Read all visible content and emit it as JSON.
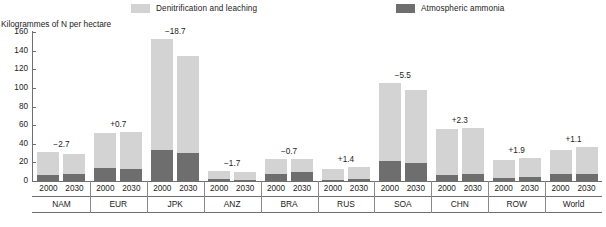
{
  "chart_data": {
    "type": "bar",
    "title": "",
    "ylabel": "Kilogrammes of N per hectare",
    "xlabel": "",
    "ylim": [
      0,
      160
    ],
    "yticks": [
      0,
      20,
      40,
      60,
      80,
      100,
      120,
      140,
      160
    ],
    "grid": false,
    "legend_position": "top",
    "stacked": true,
    "legend": [
      {
        "name": "Denitrification and leaching",
        "color": "#d3d3d3"
      },
      {
        "name": "Atmospheric ammonia",
        "color": "#6e6e6e"
      }
    ],
    "series": [
      {
        "name": "Atmospheric ammonia",
        "color": "#6e6e6e",
        "values": [
          6.5,
          7.5,
          13.5,
          13.0,
          33.0,
          30.0,
          2.0,
          1.5,
          7.5,
          9.5,
          1.5,
          2.0,
          21.5,
          19.0,
          6.5,
          8.0,
          3.0,
          4.0,
          7.0,
          8.0
        ]
      },
      {
        "name": "Denitrification and leaching",
        "color": "#d3d3d3",
        "values": [
          25.0,
          21.5,
          38.5,
          40.0,
          120.0,
          104.0,
          9.0,
          8.0,
          16.5,
          14.0,
          11.5,
          13.0,
          83.5,
          79.0,
          49.5,
          49.0,
          20.0,
          21.0,
          26.0,
          28.0
        ]
      }
    ],
    "x": [
      "2000",
      "2030",
      "2000",
      "2030",
      "2000",
      "2030",
      "2000",
      "2030",
      "2000",
      "2030",
      "2000",
      "2030",
      "2000",
      "2030",
      "2000",
      "2030",
      "2000",
      "2030",
      "2000",
      "2030"
    ],
    "totals": [
      31.5,
      29.0,
      52.0,
      53.0,
      153.0,
      134.0,
      11.0,
      9.5,
      24.0,
      23.5,
      13.0,
      15.0,
      105.0,
      98.0,
      56.0,
      57.0,
      23.0,
      25.0,
      33.0,
      36.0
    ],
    "groups": [
      {
        "label": "NAM",
        "delta": "−2.7",
        "years": [
          "2000",
          "2030"
        ],
        "values_ammonia": [
          6.5,
          7.5
        ],
        "values_denit": [
          25.0,
          21.5
        ],
        "totals": [
          31.5,
          29.0
        ]
      },
      {
        "label": "EUR",
        "delta": "+0.7",
        "years": [
          "2000",
          "2030"
        ],
        "values_ammonia": [
          13.5,
          13.0
        ],
        "values_denit": [
          38.5,
          40.0
        ],
        "totals": [
          52.0,
          53.0
        ]
      },
      {
        "label": "JPK",
        "delta": "−18.7",
        "years": [
          "2000",
          "2030"
        ],
        "values_ammonia": [
          33.0,
          30.0
        ],
        "values_denit": [
          120.0,
          104.0
        ],
        "totals": [
          153.0,
          134.0
        ]
      },
      {
        "label": "ANZ",
        "delta": "−1.7",
        "years": [
          "2000",
          "2030"
        ],
        "values_ammonia": [
          2.0,
          1.5
        ],
        "values_denit": [
          9.0,
          8.0
        ],
        "totals": [
          11.0,
          9.5
        ]
      },
      {
        "label": "BRA",
        "delta": "−0.7",
        "years": [
          "2000",
          "2030"
        ],
        "values_ammonia": [
          7.5,
          9.5
        ],
        "values_denit": [
          16.5,
          14.0
        ],
        "totals": [
          24.0,
          23.5
        ]
      },
      {
        "label": "RUS",
        "delta": "+1.4",
        "years": [
          "2000",
          "2030"
        ],
        "values_ammonia": [
          1.5,
          2.0
        ],
        "values_denit": [
          11.5,
          13.0
        ],
        "totals": [
          13.0,
          15.0
        ]
      },
      {
        "label": "SOA",
        "delta": "−5.5",
        "years": [
          "2000",
          "2030"
        ],
        "values_ammonia": [
          21.5,
          19.0
        ],
        "values_denit": [
          83.5,
          79.0
        ],
        "totals": [
          105.0,
          98.0
        ]
      },
      {
        "label": "CHN",
        "delta": "+2.3",
        "years": [
          "2000",
          "2030"
        ],
        "values_ammonia": [
          6.5,
          8.0
        ],
        "values_denit": [
          49.5,
          49.0
        ],
        "totals": [
          56.0,
          57.0
        ]
      },
      {
        "label": "ROW",
        "delta": "+1.9",
        "years": [
          "2000",
          "2030"
        ],
        "values_ammonia": [
          3.0,
          4.0
        ],
        "values_denit": [
          20.0,
          21.0
        ],
        "totals": [
          23.0,
          25.0
        ]
      },
      {
        "label": "World",
        "delta": "+1.1",
        "years": [
          "2000",
          "2030"
        ],
        "values_ammonia": [
          7.0,
          8.0
        ],
        "values_denit": [
          26.0,
          28.0
        ],
        "totals": [
          33.0,
          36.0
        ]
      }
    ]
  },
  "legend": {
    "denitrification_label": "Denitrification and leaching",
    "ammonia_label": "Atmospheric ammonia"
  },
  "axis": {
    "y_title": "Kilogrammes of N per hectare",
    "ticks": [
      "160",
      "140",
      "120",
      "100",
      "80",
      "60",
      "40",
      "20",
      "0"
    ]
  },
  "colors": {
    "denitrification": "#d3d3d3",
    "ammonia": "#6e6e6e",
    "axis": "#6f6f6f",
    "text": "#1b1b1b",
    "background": "#ffffff"
  }
}
